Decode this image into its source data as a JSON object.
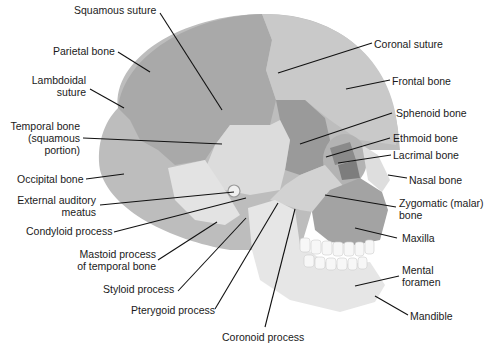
{
  "diagram": {
    "colors": {
      "parietal": "#a9a9a9",
      "frontal": "#c9c9c9",
      "temporal": "#dcdcdc",
      "occipital": "#bdbdbd",
      "sphenoid": "#9a9a9a",
      "ethmoid": "#8a8a8a",
      "lacrimal": "#7d7d7d",
      "maxilla": "#a3a3a3",
      "zygomatic": "#d2d2d2",
      "mandible": "#e6e6e6",
      "teeth": "#f7f7f7",
      "leader_line": "#111111",
      "label_text": "#1a1a1a"
    },
    "labels": {
      "squamous_suture": "Squamous suture",
      "parietal_bone": "Parietal bone",
      "lambdoidal_suture_1": "Lambdoidal",
      "lambdoidal_suture_2": "suture",
      "temporal_bone_1": "Temporal bone",
      "temporal_bone_2": "(squamous",
      "temporal_bone_3": "portion)",
      "occipital_bone": "Occipital bone",
      "external_auditory_1": "External auditory",
      "external_auditory_2": "meatus",
      "condyloid_process": "Condyloid process",
      "mastoid_process_1": "Mastoid process",
      "mastoid_process_2": "of temporal bone",
      "styloid_process": "Styloid process",
      "pterygoid_process": "Pterygoid process",
      "coronoid_process": "Coronoid process",
      "coronal_suture": "Coronal suture",
      "frontal_bone": "Frontal bone",
      "sphenoid_bone": "Sphenoid bone",
      "ethmoid_bone": "Ethmoid bone",
      "lacrimal_bone": "Lacrimal bone",
      "nasal_bone": "Nasal bone",
      "zygomatic_1": "Zygomatic (malar)",
      "zygomatic_2": "bone",
      "maxilla": "Maxilla",
      "mental_foramen_1": "Mental",
      "mental_foramen_2": "foramen",
      "mandible": "Mandible"
    }
  }
}
